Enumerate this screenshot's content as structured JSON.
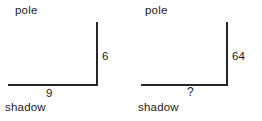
{
  "figure": {
    "background_color": "#ffffff",
    "line_color": "#262626",
    "text_color": "#1a1a1a"
  },
  "chart_data": {
    "type": "diagram",
    "title": "",
    "panels": [
      {
        "name": "left",
        "vertical_label": "pole",
        "vertical_value": "6",
        "horizontal_label": "shadow",
        "horizontal_value": "9",
        "unknown": false
      },
      {
        "name": "right",
        "vertical_label": "pole",
        "vertical_value": "64",
        "horizontal_label": "shadow",
        "horizontal_value": "?",
        "unknown": true
      }
    ]
  },
  "diagrams": {
    "left": {
      "pole_label": "pole",
      "pole_measure": "6",
      "shadow_label": "shadow",
      "shadow_measure": "9"
    },
    "right": {
      "pole_label": "pole",
      "pole_measure": "64",
      "shadow_label": "shadow",
      "shadow_measure": "?"
    }
  }
}
